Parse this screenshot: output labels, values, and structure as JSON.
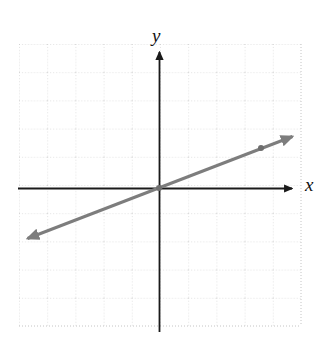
{
  "figure": {
    "width": 320,
    "height": 338,
    "background_color": "#ffffff",
    "type": "cartesian-line-graph"
  },
  "axes": {
    "x_label": "x",
    "y_label": "y",
    "axis_color": "#1a1a1a",
    "x_axis_y_px": 188,
    "y_axis_x_px": 159,
    "x_axis_start_px": 18,
    "x_axis_end_px": 297,
    "y_axis_top_px": 46,
    "y_axis_bottom_px": 330,
    "has_x_arrow": true,
    "has_y_arrow": true
  },
  "grid": {
    "color": "#c9c9c9",
    "style": "dotted",
    "cell_size_px": 28,
    "left_px": 19,
    "right_px": 301,
    "top_px": 44,
    "bottom_px": 326,
    "columns": 10,
    "rows": 10
  },
  "chart_data": {
    "type": "line",
    "title": "",
    "xlabel": "x",
    "ylabel": "y",
    "grid": true,
    "legend": "none",
    "xlim": [
      -5,
      5
    ],
    "ylim": [
      -5,
      5
    ],
    "series": [
      {
        "name": "line",
        "equation": "y = 0.5x",
        "slope": 0.5,
        "y_intercept": 0,
        "color": "#7d7d7d",
        "stroke_width": 3,
        "arrows": "both",
        "x": [
          -5,
          5
        ],
        "y": [
          -2.5,
          2.5
        ],
        "endpoints_px": [
          {
            "x": 21,
            "y": 241
          },
          {
            "x": 299,
            "y": 134
          }
        ],
        "points": [
          {
            "x": 0,
            "y": 0,
            "px": 159,
            "py": 188
          },
          {
            "x": 3.6,
            "y": 1.5,
            "px": 261,
            "py": 148
          }
        ]
      }
    ]
  },
  "markers": {
    "color": "#6e6e6e",
    "radius_px": 3
  }
}
